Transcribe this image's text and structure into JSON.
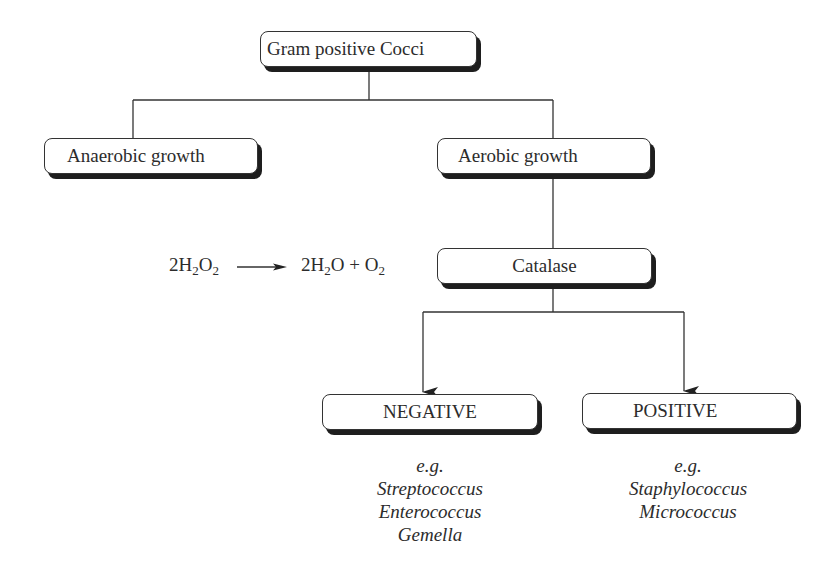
{
  "diagram": {
    "nodes": {
      "root": {
        "label": "Gram positive Cocci"
      },
      "anaerobic": {
        "label": "Anaerobic growth"
      },
      "aerobic": {
        "label": "Aerobic growth"
      },
      "catalase": {
        "label": "Catalase"
      },
      "negative": {
        "label": "NEGATIVE"
      },
      "positive": {
        "label": "POSITIVE"
      }
    },
    "equation": {
      "reactant_coef": "2",
      "reactant_a": "H",
      "reactant_a_sub": "2",
      "reactant_b": "O",
      "reactant_b_sub": "2",
      "product1_coef": "2",
      "product1_a": "H",
      "product1_a_sub": "2",
      "product1_b": "O",
      "plus": " + ",
      "product2": "O",
      "product2_sub": "2"
    },
    "negative_examples": {
      "prefix": "e.g.",
      "items": [
        "Streptococcus",
        "Enterococcus",
        "Gemella"
      ]
    },
    "positive_examples": {
      "prefix": "e.g.",
      "items": [
        "Staphylococcus",
        "Micrococcus"
      ]
    },
    "edges": [
      {
        "from": "root",
        "to": "anaerobic",
        "arrow": false
      },
      {
        "from": "root",
        "to": "aerobic",
        "arrow": false
      },
      {
        "from": "aerobic",
        "to": "catalase",
        "arrow": false
      },
      {
        "from": "catalase",
        "to": "negative",
        "arrow": true
      },
      {
        "from": "catalase",
        "to": "positive",
        "arrow": true
      }
    ],
    "colors": {
      "line": "#333333",
      "shadow": "#1e1e1e",
      "text": "#2c2c2c",
      "background": "#ffffff"
    }
  }
}
